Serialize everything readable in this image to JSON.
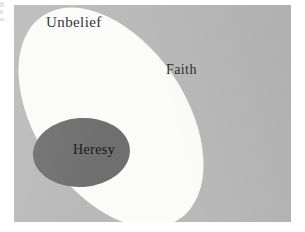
{
  "figure": {
    "type": "nested-set-diagram",
    "colors": {
      "page_background": "#ffffff",
      "universe_fill": "#b9b9b9",
      "faith_fill": "#fbfbf9",
      "heresy_fill": "#6f6f6f",
      "label_text": "#2a2a2a"
    }
  },
  "sets": {
    "universe": {
      "label": "Unbelief",
      "shape": "rectangle"
    },
    "outer": {
      "label": "Faith",
      "shape": "ellipse"
    },
    "inner": {
      "label": "Heresy",
      "shape": "ellipse"
    }
  }
}
